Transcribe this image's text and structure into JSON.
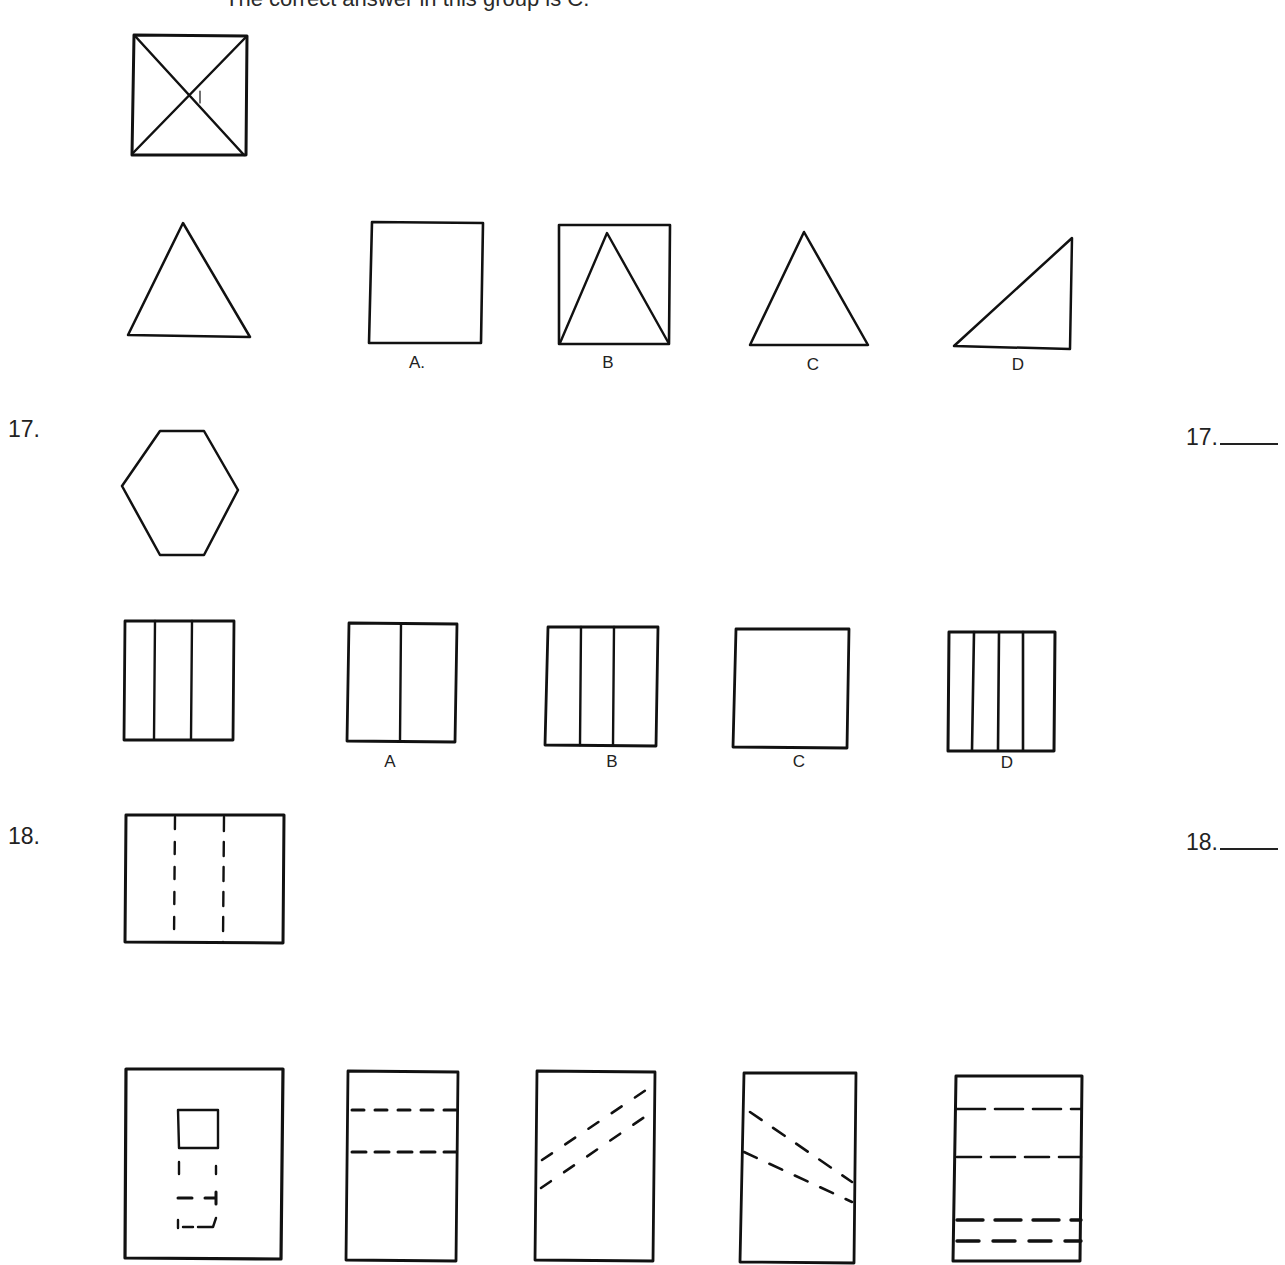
{
  "header": {
    "caption": "The correct answer in this group is C."
  },
  "example": {
    "stem_figure": "square-with-x-diagonals",
    "prompt_figure": "equilateral-triangle",
    "options": [
      {
        "label": "A.",
        "figure": "square"
      },
      {
        "label": "B",
        "figure": "square-with-inscribed-triangle"
      },
      {
        "label": "C",
        "figure": "triangle"
      },
      {
        "label": "D",
        "figure": "right-triangle"
      }
    ]
  },
  "questions": [
    {
      "number": "17.",
      "answer_label": "17.",
      "stem_figure": "hexagon",
      "prompt_figure": "rectangle-three-columns",
      "options": [
        {
          "label": "A",
          "figure": "rectangle-two-columns"
        },
        {
          "label": "B",
          "figure": "rectangle-three-columns"
        },
        {
          "label": "C",
          "figure": "square-empty"
        },
        {
          "label": "D",
          "figure": "rectangle-four-columns"
        }
      ]
    },
    {
      "number": "18.",
      "answer_label": "18.",
      "stem_figure": "rectangle-two-vertical-dashed-lines",
      "prompt_figure": "square-with-small-square-and-dashed-square",
      "options": [
        {
          "label": "A",
          "figure": "rectangle-two-horizontal-dashed-lines"
        },
        {
          "label": "B",
          "figure": "rectangle-two-diagonal-dashed-lines-ascending"
        },
        {
          "label": "C",
          "figure": "rectangle-two-diagonal-dashed-lines-descending"
        },
        {
          "label": "D",
          "figure": "rectangle-four-horizontal-dashed-lines"
        }
      ]
    }
  ]
}
